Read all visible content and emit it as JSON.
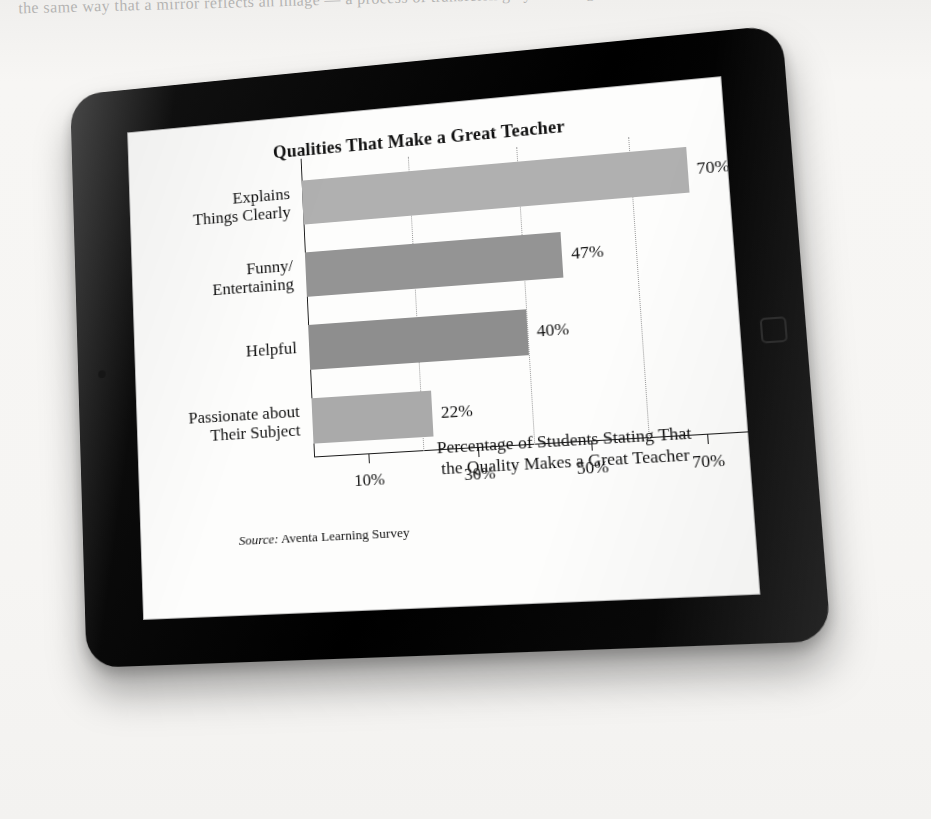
{
  "scene": {
    "device": "tablet",
    "device_home_button": "home-button",
    "background_note": "Ghosted text line at top of scanned page"
  },
  "page": {
    "ghost_text": "the same way that a mirror reflects an image — a process of transferring by knowing"
  },
  "chart_data": {
    "type": "bar",
    "orientation": "horizontal",
    "title": "Qualities That Make a Great Teacher",
    "categories": [
      "Explains\nThings Clearly",
      "Funny/\nEntertaining",
      "Helpful",
      "Passionate about\nTheir Subject"
    ],
    "category_lines": [
      [
        "Explains",
        "Things Clearly"
      ],
      [
        "Funny/",
        "Entertaining"
      ],
      [
        "Helpful",
        ""
      ],
      [
        "Passionate about",
        "Their Subject"
      ]
    ],
    "values": [
      70,
      47,
      40,
      22
    ],
    "value_labels": [
      "70%",
      "47%",
      "40%",
      "22%"
    ],
    "bar_colors": [
      "#b0b0b0",
      "#949494",
      "#8e8e8e",
      "#aaaaaa"
    ],
    "xlabel": "Percentage of Students Stating That the Quality Makes a Great Teacher",
    "xlabel_lines": [
      "Percentage of Students Stating That",
      "the Quality Makes a Great Teacher"
    ],
    "ylabel": "",
    "xlim": [
      0,
      95
    ],
    "xticks": [
      10,
      30,
      50,
      70,
      90
    ],
    "xtick_labels": [
      "10%",
      "30%",
      "50%",
      "70%",
      "90%"
    ],
    "gridlines_at": [
      20,
      40,
      60,
      80
    ],
    "grid": true,
    "grid_style": "dotted",
    "legend": "none",
    "source_prefix": "Source:",
    "source_text": " Aventa Learning Survey"
  }
}
